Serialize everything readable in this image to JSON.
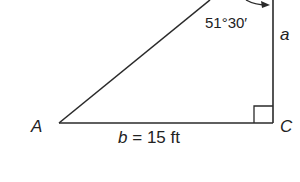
{
  "diagram": {
    "type": "right-triangle",
    "vertices": {
      "A": "A",
      "C": "C"
    },
    "angle_label": "51°30′",
    "side_a_label": "a",
    "side_b_label_var": "b",
    "side_b_label_eq": "=",
    "side_b_label_value": "15 ft",
    "right_angle_at": "C",
    "colors": {
      "stroke": "#2a2a2a",
      "background": "#ffffff"
    }
  }
}
